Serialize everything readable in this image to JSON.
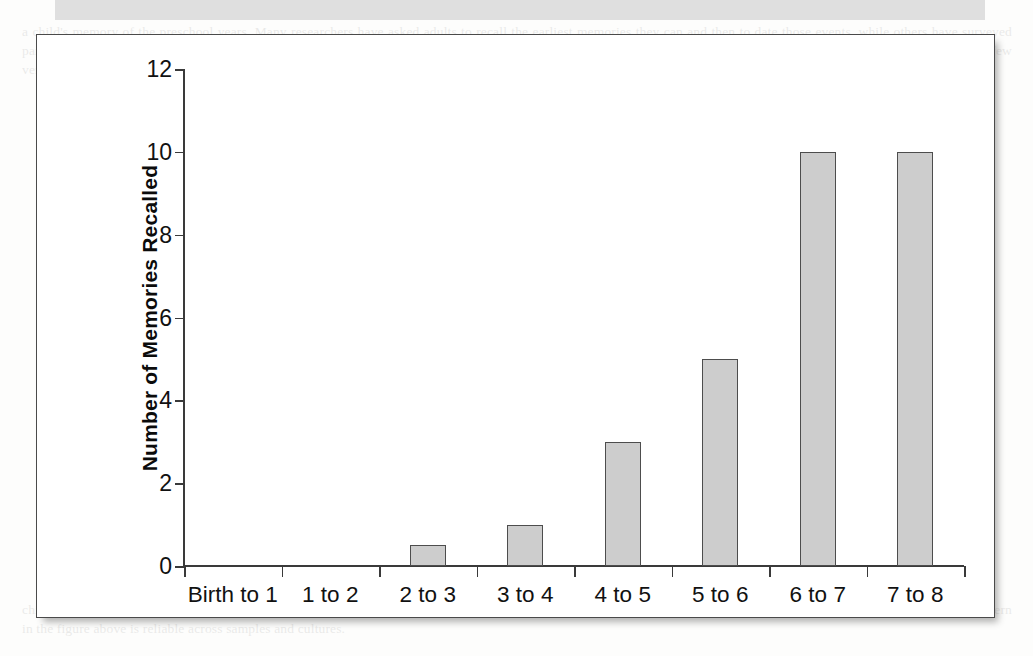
{
  "page": {
    "background_bleed_top": "a child's memory of the preschool years. Many researchers have asked adults to recall the earliest memories they can and then to date those events, while others have surveyed parents about what their children remember from infancy. The resulting picture suggests that autobiographical recall climbs steeply after the third birthday and that very few verifiable memories survive from the first two years of life.",
    "background_bleed_bottom": "childhood amnesia, and the explanations offered for it range from immature hippocampal encoding to the absence of a stable narrative self. Whatever the mechanism, the pattern in the figure above is reliable across samples and cultures.",
    "top_band_color": "#d9d9d9",
    "frame_border_color": "#4a4a4a"
  },
  "chart_data": {
    "type": "bar",
    "title": "",
    "subtitle": "",
    "xlabel": "",
    "ylabel": "Number of Memories Recalled",
    "categories": [
      "Birth to 1",
      "1 to 2",
      "2 to 3",
      "3 to 4",
      "4 to 5",
      "5 to 6",
      "6 to 7",
      "7 to 8"
    ],
    "values": [
      0,
      0,
      0.5,
      1,
      3,
      5,
      10,
      10
    ],
    "ylim": [
      0,
      12
    ],
    "yticks": [
      0,
      2,
      4,
      6,
      8,
      10,
      12
    ],
    "ytick_labels": [
      "0",
      "2",
      "4",
      "6",
      "8",
      "10",
      "12"
    ],
    "grid": false,
    "legend": false,
    "bar_fill_color": "#cdcdcd",
    "bar_border_color": "#4d4d4d",
    "axis_color": "#3a3a3a"
  }
}
